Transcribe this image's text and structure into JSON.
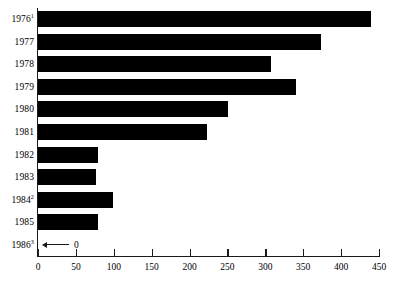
{
  "chart_data": {
    "type": "bar",
    "orientation": "horizontal",
    "title": "",
    "subtitle": "",
    "xlabel": "",
    "ylabel": "",
    "categories": [
      "1976",
      "1977",
      "1978",
      "1979",
      "1980",
      "1981",
      "1982",
      "1983",
      "1984",
      "1985",
      "1986"
    ],
    "category_labels": [
      "1976¹",
      "1977",
      "1978",
      "1979",
      "1980",
      "1981",
      "1982",
      "1983",
      "1984²",
      "1985",
      "1986³"
    ],
    "category_footnotes": [
      "1",
      "",
      "",
      "",
      "",
      "",
      "",
      "",
      "2",
      "",
      "3"
    ],
    "values": [
      440,
      374,
      307,
      340,
      251,
      223,
      79,
      76,
      99,
      79,
      0
    ],
    "xlim": [
      0,
      450
    ],
    "xticks": [
      0,
      50,
      100,
      150,
      200,
      250,
      300,
      350,
      400,
      450
    ],
    "xtick_labels": [
      "0",
      "50",
      "100",
      "150",
      "200",
      "250",
      "300",
      "350",
      "400",
      "450"
    ],
    "grid": false,
    "legend": null,
    "bar_color": "#000000",
    "axis_color": "#1a1a1a",
    "background_color": "#ffffff",
    "annotations": [
      {
        "category": "1986",
        "text": "0",
        "marker": "left-arrow",
        "description": "arrow pointing to axis with value 0"
      }
    ]
  }
}
